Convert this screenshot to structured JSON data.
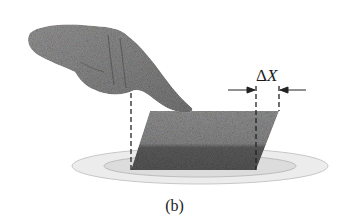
{
  "figure": {
    "caption": "(b)",
    "delta_label": "ΔX",
    "delta_symbol": "Δ",
    "delta_var": "X",
    "elements": {
      "hand": "pointing-hand",
      "block": "sheared-block",
      "plate": "plate",
      "dimension": "displacement-arrows"
    },
    "colors": {
      "block_top": "#8e8e8e",
      "block_bottom": "#5a5a5a",
      "hand": "#8a8a8a",
      "plate_outer": "#e2e2e2",
      "plate_inner": "#c9c9c9",
      "dash": "#222222"
    }
  }
}
